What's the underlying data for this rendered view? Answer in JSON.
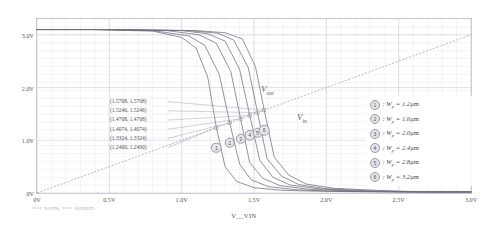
{
  "chart_data": {
    "type": "line",
    "title": "",
    "xlabel": "V__VIN",
    "ylabel": "",
    "xlim": [
      0,
      3.0
    ],
    "ylim": [
      0,
      3.3
    ],
    "grid": true,
    "xticks": [
      "0V",
      "0.5V",
      "1.0V",
      "1.5V",
      "2.0V",
      "2.5V",
      "3.0V"
    ],
    "xtick_values": [
      0,
      0.5,
      1.0,
      1.5,
      2.0,
      2.5,
      3.0
    ],
    "yticks": [
      "0V",
      "1.0V",
      "2.0V",
      "3.0V"
    ],
    "ytick_values": [
      0,
      1.0,
      2.0,
      3.0
    ],
    "legend_position": "right",
    "series": [
      {
        "name": "1",
        "label": "Wp = 1.2 um",
        "wp": 1.2,
        "vm": 1.24,
        "x": [
          0,
          0.4,
          0.8,
          1.0,
          1.1,
          1.18,
          1.24,
          1.3,
          1.38,
          1.5,
          1.7,
          2.0,
          2.5,
          3.0
        ],
        "y": [
          3.1,
          3.1,
          3.07,
          2.95,
          2.75,
          2.2,
          1.24,
          0.5,
          0.22,
          0.1,
          0.05,
          0.03,
          0.02,
          0.02
        ]
      },
      {
        "name": "2",
        "label": "Wp = 1.6 um",
        "wp": 1.6,
        "vm": 1.3324,
        "x": [
          0,
          0.4,
          0.8,
          1.05,
          1.16,
          1.26,
          1.3324,
          1.4,
          1.48,
          1.6,
          1.8,
          2.1,
          2.5,
          3.0
        ],
        "y": [
          3.1,
          3.1,
          3.08,
          2.98,
          2.8,
          2.25,
          1.3324,
          0.55,
          0.25,
          0.12,
          0.06,
          0.03,
          0.02,
          0.02
        ]
      },
      {
        "name": "3",
        "label": "Wp = 2.0 um",
        "wp": 2.0,
        "vm": 1.4074,
        "x": [
          0,
          0.4,
          0.9,
          1.12,
          1.24,
          1.34,
          1.4074,
          1.47,
          1.56,
          1.68,
          1.88,
          2.15,
          2.6,
          3.0
        ],
        "y": [
          3.1,
          3.1,
          3.08,
          3.0,
          2.84,
          2.3,
          1.4074,
          0.58,
          0.28,
          0.14,
          0.07,
          0.04,
          0.02,
          0.02
        ]
      },
      {
        "name": "4",
        "label": "Wp = 2.4 um",
        "wp": 2.4,
        "vm": 1.4708,
        "x": [
          0,
          0.5,
          1.0,
          1.18,
          1.3,
          1.4,
          1.4708,
          1.54,
          1.63,
          1.75,
          1.95,
          2.2,
          2.6,
          3.0
        ],
        "y": [
          3.1,
          3.1,
          3.08,
          3.02,
          2.88,
          2.35,
          1.4708,
          0.62,
          0.3,
          0.15,
          0.08,
          0.04,
          0.02,
          0.02
        ]
      },
      {
        "name": "5",
        "label": "Wp = 2.8 um",
        "wp": 2.8,
        "vm": 1.5246,
        "x": [
          0,
          0.5,
          1.05,
          1.25,
          1.36,
          1.46,
          1.5246,
          1.59,
          1.69,
          1.81,
          2.0,
          2.3,
          2.7,
          3.0
        ],
        "y": [
          3.1,
          3.1,
          3.08,
          3.03,
          2.9,
          2.38,
          1.5246,
          0.65,
          0.32,
          0.16,
          0.08,
          0.04,
          0.02,
          0.02
        ]
      },
      {
        "name": "6",
        "label": "Wp = 3.2 um",
        "wp": 3.2,
        "vm": 1.5708,
        "x": [
          0,
          0.5,
          1.1,
          1.3,
          1.42,
          1.51,
          1.5708,
          1.64,
          1.74,
          1.86,
          2.05,
          2.35,
          2.7,
          3.0
        ],
        "y": [
          3.1,
          3.1,
          3.08,
          3.04,
          2.92,
          2.4,
          1.5708,
          0.68,
          0.34,
          0.17,
          0.09,
          0.05,
          0.02,
          0.02
        ]
      },
      {
        "name": "vin",
        "label": "V_in reference (unity slope)",
        "is_reference": true,
        "x": [
          0,
          3.0
        ],
        "y": [
          0,
          3.0
        ]
      }
    ],
    "annotations": {
      "vout_label": "Vout",
      "vin_label": "Vin",
      "coordinates": [
        "(1.5708,  1.5708)",
        "(1.5246,  1.5246)",
        "(1.4708,  1.4708)",
        "(1.4074,  1.4074)",
        "(1.3324,  1.3324)",
        "(1.2400,  1.2400)"
      ]
    },
    "markers": [
      {
        "label": "1",
        "x": 1.24,
        "y": 1.24
      },
      {
        "label": "2",
        "x": 1.3324,
        "y": 1.3324
      },
      {
        "label": "3",
        "x": 1.4074,
        "y": 1.4074
      },
      {
        "label": "4",
        "x": 1.4708,
        "y": 1.4708
      },
      {
        "label": "5",
        "x": 1.5246,
        "y": 1.5246
      },
      {
        "label": "6",
        "x": 1.5708,
        "y": 1.5708
      }
    ],
    "colors": {
      "curve": "#6f6f7a",
      "reference": "#9a9aa6",
      "grid": "#e8e8f0",
      "frame": "#b9b9c4",
      "text": "#4a4a55"
    }
  },
  "legend": {
    "items": [
      {
        "badge": "1",
        "var": "W",
        "sub": "p",
        "eq": "=",
        "value": "1.2",
        "unit": "μm"
      },
      {
        "badge": "2",
        "var": "W",
        "sub": "p",
        "eq": "=",
        "value": "1.6",
        "unit": "μm"
      },
      {
        "badge": "3",
        "var": "W",
        "sub": "p",
        "eq": "=",
        "value": "2.0",
        "unit": "μm"
      },
      {
        "badge": "4",
        "var": "W",
        "sub": "p",
        "eq": "=",
        "value": "2.4",
        "unit": "μm"
      },
      {
        "badge": "5",
        "var": "W",
        "sub": "p",
        "eq": "=",
        "value": "2.8",
        "unit": "μm"
      },
      {
        "badge": "6",
        "var": "W",
        "sub": "p",
        "eq": "=",
        "value": "3.2",
        "unit": "μm"
      }
    ]
  },
  "trace_legend": {
    "vin_trace": "V(VIN)",
    "vout_trace": "V(VOUT)"
  },
  "labels": {
    "vout": "V",
    "vout_sub": "out",
    "vin": "V",
    "vin_sub": "in",
    "x_axis_title": "V__VIN"
  }
}
